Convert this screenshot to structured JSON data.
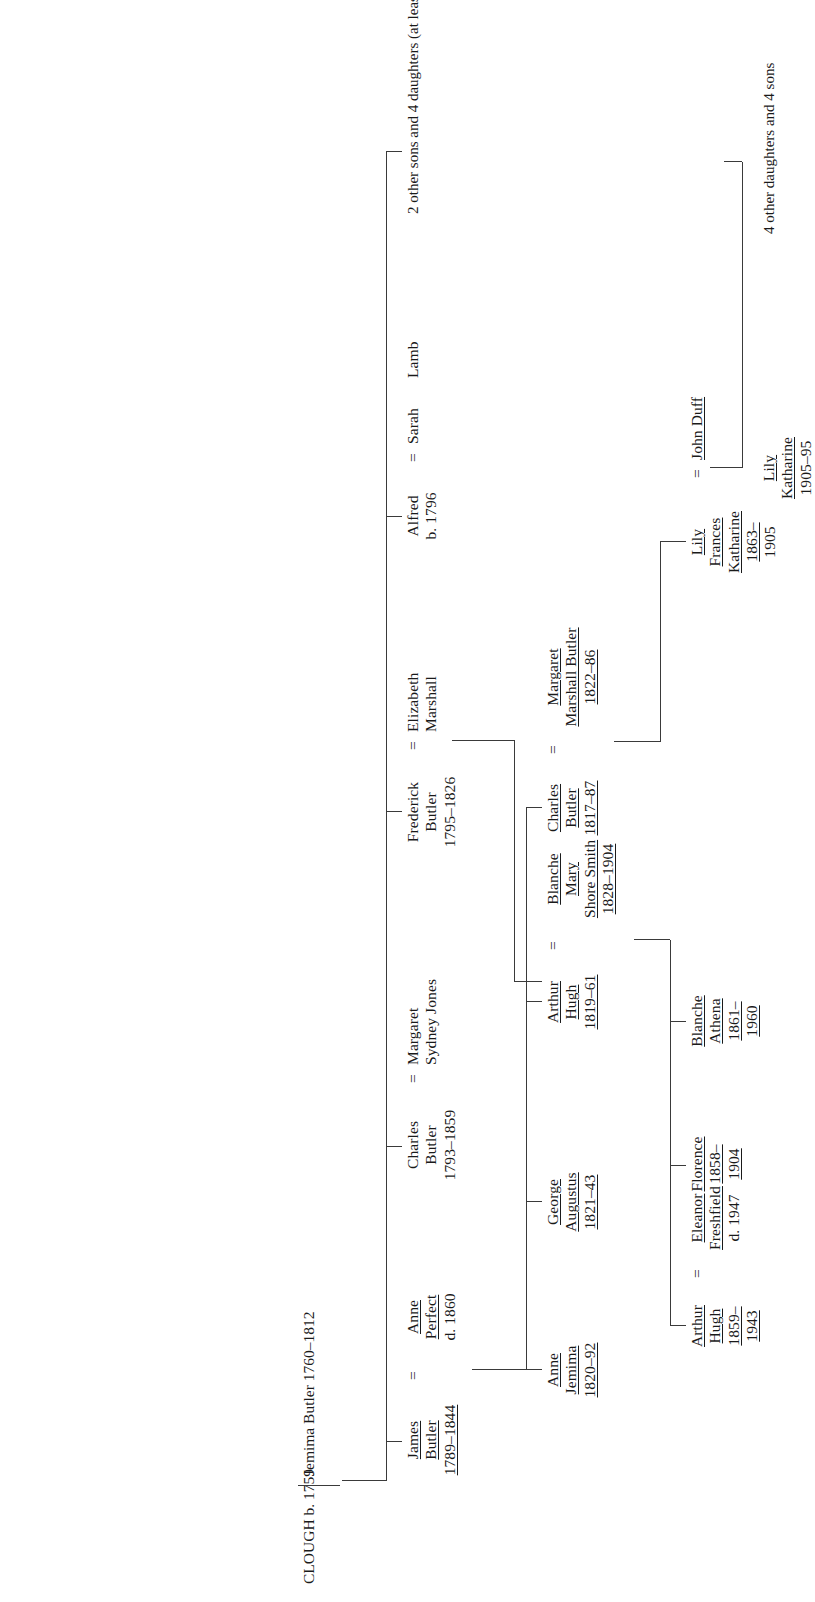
{
  "root": {
    "surname": "CLOUGH",
    "born": "b. 1759",
    "spouse_line1": "Jemima",
    "spouse_line2": "Butler 1760–1812"
  },
  "generation1": [
    {
      "id": "james",
      "name_lines": [
        "James",
        "Butler",
        "1789–1844"
      ],
      "underline": [
        true,
        true,
        true
      ],
      "spouse": {
        "marriage_symbol": "=",
        "lines": [
          "Anne",
          "Perfect",
          "d. 1860"
        ],
        "underline": [
          true,
          true,
          false
        ]
      }
    },
    {
      "id": "charles",
      "name_lines": [
        "Charles",
        "Butler",
        "1793–1859"
      ],
      "underline": [
        false,
        false,
        false
      ],
      "spouse": {
        "marriage_symbol": "=",
        "lines": [
          "Margaret",
          "Sydney Jones"
        ],
        "underline": [
          false,
          false
        ]
      }
    },
    {
      "id": "frederick",
      "name_lines": [
        "Frederick",
        "Butler",
        "1795–1826"
      ],
      "underline": [
        false,
        false,
        false
      ],
      "spouse": {
        "marriage_symbol": "=",
        "lines": [
          "Elizabeth",
          "Marshall"
        ],
        "underline": [
          false,
          false
        ]
      }
    },
    {
      "id": "alfred",
      "name_lines": [
        "Alfred",
        "b. 1796"
      ],
      "underline": [
        false,
        false
      ],
      "spouse": {
        "marriage_symbol": "=",
        "lines": [
          "Sarah",
          "Lamb"
        ],
        "underline": [
          false,
          false
        ]
      }
    }
  ],
  "notes": {
    "top_siblings": [
      "2 other sons",
      "and 4 daughters",
      "(at least)"
    ],
    "duff_children": [
      "4 other daughters",
      "and 4 sons"
    ]
  },
  "generation2": [
    {
      "id": "anne-jemima",
      "name_lines": [
        "Anne",
        "Jemima",
        "1820–92"
      ],
      "underline": [
        true,
        true,
        true
      ]
    },
    {
      "id": "george-augustus",
      "name_lines": [
        "George",
        "Augustus",
        "1821–43"
      ],
      "underline": [
        true,
        true,
        true
      ]
    },
    {
      "id": "arthur-hugh",
      "name_lines": [
        "Arthur",
        "Hugh",
        "1819–61"
      ],
      "underline": [
        true,
        true,
        true
      ],
      "spouse": {
        "marriage_symbol": "=",
        "lines": [
          "Blanche",
          "Mary",
          "Shore Smith",
          "1828–1904"
        ],
        "underline": [
          true,
          true,
          true,
          true
        ]
      }
    },
    {
      "id": "charles-butler-2",
      "name_lines": [
        "Charles",
        "Butler",
        "1817–87"
      ],
      "underline": [
        true,
        true,
        true
      ],
      "spouse": {
        "marriage_symbol": "=",
        "lines": [
          "Margaret",
          "Marshall Butler",
          "1822–86"
        ],
        "underline": [
          true,
          true,
          true
        ]
      }
    }
  ],
  "generation3": [
    {
      "id": "arthur-hugh-jr",
      "name_lines": [
        "Arthur",
        "Hugh",
        "1859–",
        "1943"
      ],
      "underline": [
        true,
        true,
        true,
        true
      ],
      "spouse": {
        "marriage_symbol": "=",
        "lines": [
          "Eleanor",
          "Freshfield",
          "d. 1947"
        ],
        "underline": [
          true,
          true,
          false
        ]
      }
    },
    {
      "id": "florence",
      "name_lines": [
        "Florence",
        "1858–",
        "1904"
      ],
      "underline": [
        true,
        true,
        true
      ]
    },
    {
      "id": "blanche-athena",
      "name_lines": [
        "Blanche",
        "Athena",
        "1861–",
        "1960"
      ],
      "underline": [
        true,
        true,
        true,
        true
      ]
    },
    {
      "id": "lily-frances-katharine",
      "name_lines": [
        "Lily",
        "Frances",
        "Katharine",
        "1863–",
        "1905"
      ],
      "underline": [
        true,
        true,
        true,
        true,
        false
      ],
      "spouse": {
        "marriage_symbol": "=",
        "lines": [
          "John Duff"
        ],
        "underline": [
          true
        ]
      }
    }
  ],
  "generation4": [
    {
      "id": "lily-katharine",
      "name_lines": [
        "Lily",
        "Katharine",
        "1905–95"
      ],
      "underline": [
        true,
        true,
        false
      ]
    }
  ]
}
